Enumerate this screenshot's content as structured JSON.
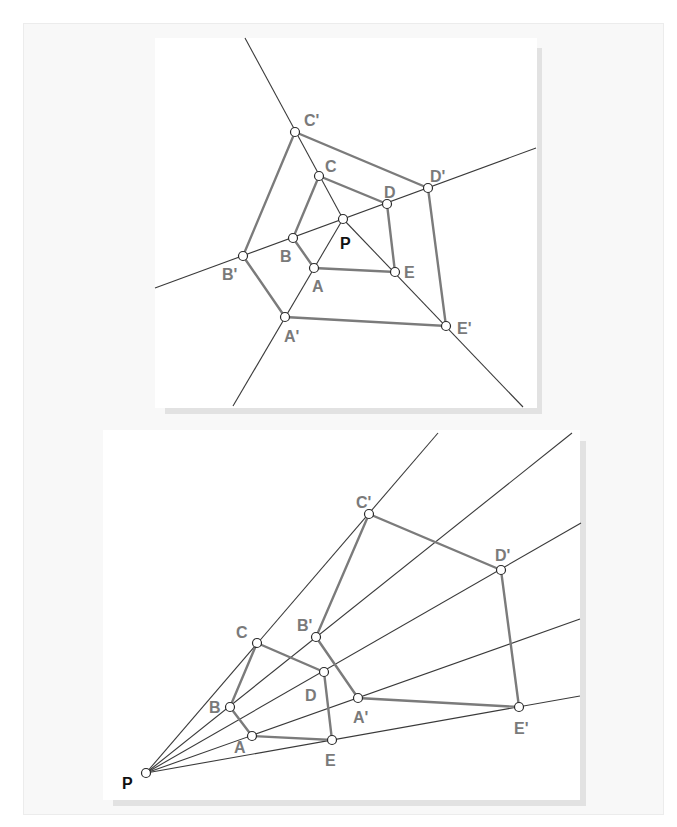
{
  "figure": {
    "colors": {
      "page_background": "#ffffff",
      "frame_background": "#f8f8f8",
      "panel_background": "#ffffff",
      "panel_shadow": "#e2e2e2",
      "ray": "#3a3a3a",
      "polygon_edge": "#7b7b7b",
      "label": "#7a7a7a",
      "center_label": "#111111"
    }
  },
  "panels": [
    {
      "id": "top",
      "title": "Dilation with center P inside the figure",
      "center": {
        "label": "P",
        "x": 343,
        "y": 219,
        "label_x": 340,
        "label_y": 249
      },
      "points": [
        {
          "label": "A",
          "x": 314,
          "y": 268,
          "label_x": 312,
          "label_y": 292
        },
        {
          "label": "B",
          "x": 293,
          "y": 238,
          "label_x": 280,
          "label_y": 262
        },
        {
          "label": "C",
          "x": 319,
          "y": 176,
          "label_x": 325,
          "label_y": 172
        },
        {
          "label": "D",
          "x": 387,
          "y": 204,
          "label_x": 384,
          "label_y": 198
        },
        {
          "label": "E",
          "x": 395,
          "y": 272,
          "label_x": 404,
          "label_y": 278
        },
        {
          "label": "A'",
          "x": 285,
          "y": 317,
          "label_x": 284,
          "label_y": 342
        },
        {
          "label": "B'",
          "x": 243,
          "y": 256,
          "label_x": 222,
          "label_y": 280
        },
        {
          "label": "C'",
          "x": 295,
          "y": 132,
          "label_x": 304,
          "label_y": 126
        },
        {
          "label": "D'",
          "x": 428,
          "y": 188,
          "label_x": 430,
          "label_y": 182
        },
        {
          "label": "E'",
          "x": 446,
          "y": 326,
          "label_x": 457,
          "label_y": 334
        }
      ],
      "rays": [
        {
          "through": "C",
          "x1": 245,
          "y1": 38,
          "x2": 343,
          "y2": 219
        },
        {
          "through": "D",
          "x1": 155,
          "y1": 288,
          "x2": 536,
          "y2": 148
        },
        {
          "through": "E",
          "x1": 343,
          "y1": 219,
          "x2": 523,
          "y2": 407
        },
        {
          "through": "A",
          "x1": 343,
          "y1": 219,
          "x2": 233,
          "y2": 406
        }
      ],
      "inner_polygon": [
        "A",
        "B",
        "C",
        "D",
        "E"
      ],
      "outer_polygon": [
        "A'",
        "B'",
        "C'",
        "D'",
        "E'"
      ]
    },
    {
      "id": "bottom",
      "title": "Dilation with center P outside the figure",
      "center": {
        "label": "P",
        "x": 146,
        "y": 773,
        "label_x": 122,
        "label_y": 789
      },
      "points": [
        {
          "label": "A",
          "x": 252,
          "y": 736,
          "label_x": 234,
          "label_y": 753
        },
        {
          "label": "B",
          "x": 230,
          "y": 707,
          "label_x": 209,
          "label_y": 713
        },
        {
          "label": "C",
          "x": 257,
          "y": 643,
          "label_x": 236,
          "label_y": 638
        },
        {
          "label": "D",
          "x": 324,
          "y": 672,
          "label_x": 305,
          "label_y": 701
        },
        {
          "label": "E",
          "x": 332,
          "y": 740,
          "label_x": 325,
          "label_y": 766
        },
        {
          "label": "A'",
          "x": 358,
          "y": 698,
          "label_x": 353,
          "label_y": 723
        },
        {
          "label": "B'",
          "x": 316,
          "y": 637,
          "label_x": 297,
          "label_y": 631
        },
        {
          "label": "C'",
          "x": 369,
          "y": 514,
          "label_x": 356,
          "label_y": 508
        },
        {
          "label": "D'",
          "x": 501,
          "y": 570,
          "label_x": 495,
          "label_y": 561
        },
        {
          "label": "E'",
          "x": 519,
          "y": 707,
          "label_x": 514,
          "label_y": 734
        }
      ],
      "rays": [
        {
          "through": "C",
          "x1": 146,
          "y1": 773,
          "x2": 438,
          "y2": 433
        },
        {
          "through": "B",
          "x1": 146,
          "y1": 773,
          "x2": 572,
          "y2": 433
        },
        {
          "through": "D",
          "x1": 146,
          "y1": 773,
          "x2": 581,
          "y2": 523
        },
        {
          "through": "A",
          "x1": 146,
          "y1": 773,
          "x2": 580,
          "y2": 619
        },
        {
          "through": "E",
          "x1": 146,
          "y1": 773,
          "x2": 580,
          "y2": 696
        }
      ],
      "inner_polygon": [
        "A",
        "B",
        "C",
        "D",
        "E"
      ],
      "outer_polygon": [
        "A'",
        "B'",
        "C'",
        "D'",
        "E'"
      ]
    }
  ]
}
